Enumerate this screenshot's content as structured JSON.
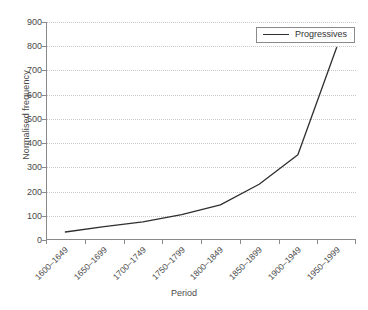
{
  "chart_data": {
    "type": "line",
    "title": "",
    "xlabel": "Period",
    "ylabel": "Normalised frequency",
    "categories": [
      "1600–1649",
      "1650–1699",
      "1700–1749",
      "1750–1799",
      "1800–1849",
      "1850–1899",
      "1900–1949",
      "1950–1999"
    ],
    "series": [
      {
        "name": "Progressives",
        "values": [
          33,
          55,
          75,
          105,
          145,
          230,
          352,
          795
        ],
        "color": "#2f2f2f"
      }
    ],
    "ylim": [
      0,
      900
    ],
    "ytick_values": [
      0,
      100,
      200,
      300,
      400,
      500,
      600,
      700,
      800,
      900
    ],
    "ytick_labels": [
      "0",
      "100",
      "200",
      "300",
      "400",
      "500",
      "600",
      "700",
      "800",
      "900"
    ],
    "grid": true,
    "grid_axis": "y",
    "grid_style": "dotted",
    "grid_color": "#c9c9c9",
    "legend_position": "top-right",
    "legend_entries": [
      "Progressives"
    ],
    "axis_color": "#8a8a8a",
    "background": "#ffffff",
    "xtick_rotation": -45
  }
}
